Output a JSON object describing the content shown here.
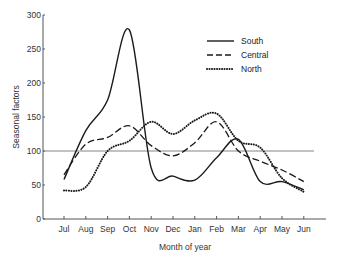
{
  "chart_data": {
    "type": "line",
    "title": "",
    "xlabel": "Month of year",
    "ylabel": "Seasonal factors",
    "categories": [
      "Jul",
      "Aug",
      "Sep",
      "Oct",
      "Nov",
      "Dec",
      "Jan",
      "Feb",
      "Mar",
      "Apr",
      "May",
      "Jun"
    ],
    "yticks": [
      0,
      50,
      100,
      150,
      200,
      250,
      300
    ],
    "ylim": [
      0,
      300
    ],
    "reference_line": 100,
    "grid": false,
    "legend_position": "upper right",
    "series": [
      {
        "name": "South",
        "style": "solid",
        "values": [
          58,
          130,
          175,
          278,
          75,
          63,
          57,
          90,
          117,
          55,
          55,
          43
        ]
      },
      {
        "name": "Central",
        "style": "dashed",
        "values": [
          65,
          110,
          120,
          137,
          108,
          93,
          112,
          143,
          100,
          85,
          72,
          55
        ]
      },
      {
        "name": "North",
        "style": "dotted",
        "values": [
          42,
          47,
          100,
          115,
          143,
          125,
          145,
          155,
          115,
          105,
          60,
          40
        ]
      }
    ]
  },
  "colors": {
    "line": "#1a1a1a",
    "axis": "#555555",
    "reference": "#666666"
  }
}
